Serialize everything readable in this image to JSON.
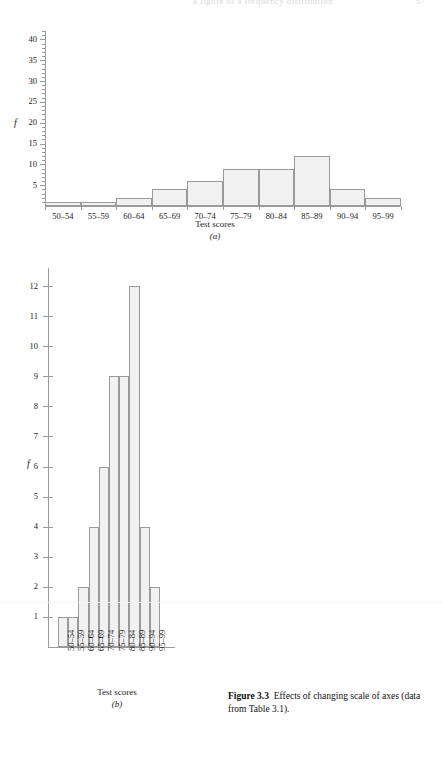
{
  "page": {
    "header_text": "a figure of a frequency distribution",
    "header_page_number": "57"
  },
  "caption": {
    "label": "Figure 3.3",
    "text": "Effects of changing scale of axes (data from Table 3.1)."
  },
  "chart_data": [
    {
      "type": "bar",
      "panel": "(a)",
      "title": "",
      "xlabel": "Test scores",
      "ylabel": "f",
      "categories": [
        "50–54",
        "55–59",
        "60–64",
        "65–69",
        "70–74",
        "75–79",
        "80–84",
        "85–89",
        "90–94",
        "95–99"
      ],
      "values": [
        1,
        1,
        2,
        4,
        6,
        9,
        9,
        12,
        4,
        2
      ],
      "ylim": [
        0,
        42
      ],
      "yticks": [
        5,
        10,
        15,
        20,
        25,
        30,
        35,
        40
      ],
      "ytick_labels": [
        "5",
        "10",
        "15",
        "20",
        "25",
        "30",
        "35",
        "40"
      ],
      "minor_ytick_step": 1,
      "grid": false,
      "legend": "none",
      "bar_fill": "#f1f1f1",
      "bar_stroke": "#9a9a9a"
    },
    {
      "type": "bar",
      "panel": "(b)",
      "title": "",
      "xlabel": "Test scores",
      "ylabel": "f",
      "categories": [
        "50–54",
        "55–59",
        "60–64",
        "65–69",
        "70–74",
        "75–79",
        "80–84",
        "85–89",
        "90–94",
        "95–99"
      ],
      "values": [
        1,
        1,
        2,
        4,
        6,
        9,
        9,
        12,
        4,
        2
      ],
      "ylim": [
        0,
        12.6
      ],
      "yticks": [
        1,
        2,
        3,
        4,
        5,
        6,
        7,
        8,
        9,
        10,
        11,
        12
      ],
      "ytick_labels": [
        "1",
        "2",
        "3",
        "4",
        "5",
        "6",
        "7",
        "8",
        "9",
        "10",
        "11",
        "12"
      ],
      "grid": false,
      "legend": "none",
      "bar_fill": "#f1f1f1",
      "bar_stroke": "#9a9a9a"
    }
  ]
}
